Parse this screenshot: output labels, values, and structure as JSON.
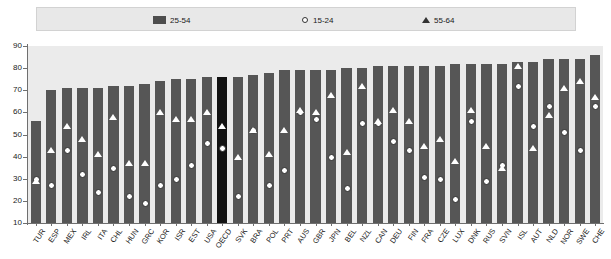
{
  "legend": {
    "items": [
      {
        "label": "25-54",
        "marker": "bar-swatch-icon",
        "color": "#565656"
      },
      {
        "label": "15-24",
        "marker": "diamond-marker-icon",
        "color": "#ffffff"
      },
      {
        "label": "55-64",
        "marker": "triangle-marker-icon",
        "color": "#ffffff"
      }
    ]
  },
  "axis": {
    "y_ticks": [
      90,
      80,
      70,
      60,
      50,
      40,
      30,
      20,
      10
    ],
    "ylim": [
      10,
      90
    ]
  },
  "colors": {
    "bar": "#565656",
    "bar_highlight": "#121212",
    "plot_background": "#ebebeb",
    "legend_background": "#e8e8e8",
    "axis": "#6f6f6f"
  },
  "chart_data": {
    "type": "bar",
    "title": "",
    "xlabel": "",
    "ylabel": "",
    "ylim": [
      10,
      90
    ],
    "grid": false,
    "legend_position": "top",
    "highlight_category": "OECD",
    "categories": [
      "TUR",
      "ESP",
      "MEX",
      "IRL",
      "ITA",
      "CHL",
      "HUN",
      "GRC",
      "KOR",
      "ISR",
      "EST",
      "USA",
      "OECD",
      "SVK",
      "BRA",
      "POL",
      "PRT",
      "AUS",
      "GBR",
      "JPN",
      "BEL",
      "NZL",
      "CAN",
      "DEU",
      "FIN",
      "FRA",
      "CZE",
      "LUX",
      "DNK",
      "RUS",
      "SVN",
      "ISL",
      "AUT",
      "NLD",
      "NOR",
      "SWE",
      "CHE"
    ],
    "series": [
      {
        "name": "25-54",
        "type": "bar",
        "values": [
          56,
          70,
          71,
          71,
          71,
          72,
          72,
          73,
          74,
          75,
          75,
          76,
          76,
          76,
          77,
          78,
          79,
          79,
          79,
          79,
          80,
          80,
          81,
          81,
          81,
          81,
          81,
          82,
          82,
          82,
          82,
          83,
          83,
          84,
          84,
          84,
          86
        ]
      },
      {
        "name": "15-24",
        "type": "scatter",
        "marker": "diamond",
        "values": [
          30,
          27,
          43,
          32,
          24,
          35,
          22,
          19,
          27,
          30,
          36,
          46,
          44,
          22,
          52,
          27,
          34,
          60,
          57,
          40,
          26,
          55,
          55,
          47,
          43,
          31,
          30,
          21,
          56,
          29,
          36,
          72,
          54,
          63,
          51,
          43,
          63
        ]
      },
      {
        "name": "55-64",
        "type": "scatter",
        "marker": "triangle",
        "values": [
          29,
          43,
          54,
          48,
          41,
          58,
          37,
          37,
          60,
          57,
          57,
          60,
          54,
          40,
          52,
          41,
          52,
          61,
          60,
          68,
          42,
          72,
          56,
          61,
          56,
          45,
          48,
          38,
          61,
          45,
          35,
          81,
          44,
          59,
          71,
          74,
          67
        ]
      }
    ]
  }
}
